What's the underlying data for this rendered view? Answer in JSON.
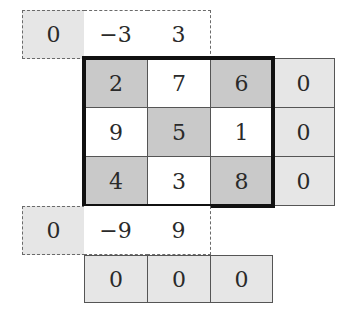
{
  "colors": {
    "light_cell": "#e6e6e6",
    "dark_cell": "#c9c9c9",
    "white_cell": "#ffffff",
    "frame": "#111111"
  },
  "top_row": [
    {
      "value": "0",
      "fill": "light"
    },
    {
      "value": "−3",
      "fill": "white"
    },
    {
      "value": "3",
      "fill": "white"
    }
  ],
  "main_grid": [
    [
      {
        "value": "2",
        "fill": "dark"
      },
      {
        "value": "7",
        "fill": "white"
      },
      {
        "value": "6",
        "fill": "dark"
      }
    ],
    [
      {
        "value": "9",
        "fill": "white"
      },
      {
        "value": "5",
        "fill": "dark"
      },
      {
        "value": "1",
        "fill": "white"
      }
    ],
    [
      {
        "value": "4",
        "fill": "dark"
      },
      {
        "value": "3",
        "fill": "white"
      },
      {
        "value": "8",
        "fill": "dark"
      }
    ]
  ],
  "right_column": [
    {
      "value": "0",
      "fill": "light"
    },
    {
      "value": "0",
      "fill": "light"
    },
    {
      "value": "0",
      "fill": "light"
    }
  ],
  "lower_row": [
    {
      "value": "0",
      "fill": "light"
    },
    {
      "value": "−9",
      "fill": "white"
    },
    {
      "value": "9",
      "fill": "white"
    }
  ],
  "bottom_row": [
    {
      "value": "0",
      "fill": "light"
    },
    {
      "value": "0",
      "fill": "light"
    },
    {
      "value": "0",
      "fill": "light"
    }
  ]
}
